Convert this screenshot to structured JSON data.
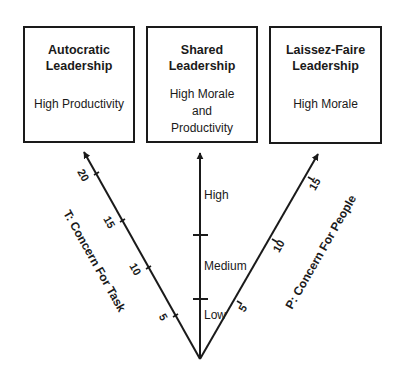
{
  "boxes": [
    {
      "title": "Autocratic\nLeadership",
      "body": "High Productivity"
    },
    {
      "title": "Shared\nLeadership",
      "body": "High Morale\nand\nProductivity"
    },
    {
      "title": "Laissez-Faire\nLeadership",
      "body": "High Morale"
    }
  ],
  "axes": {
    "task": {
      "label": "T: Concern For Task",
      "ticks": [
        "5",
        "10",
        "15",
        "20"
      ]
    },
    "shared": {
      "levels": [
        "Low",
        "Medium",
        "High"
      ]
    },
    "people": {
      "label": "P: Concern For People",
      "ticks": [
        "5",
        "10",
        "15"
      ]
    }
  },
  "colors": {
    "ink": "#1a1a1a",
    "background": "#ffffff"
  }
}
